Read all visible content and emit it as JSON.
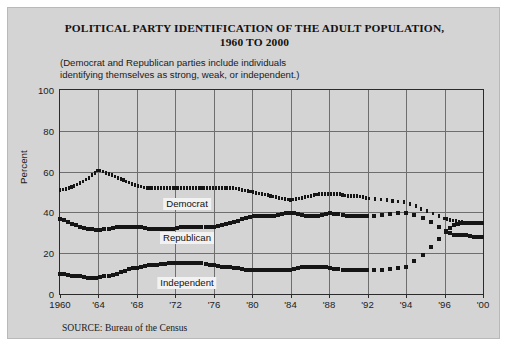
{
  "figure": {
    "title_line1": "POLITICAL PARTY IDENTIFICATION OF THE ADULT POPULATION,",
    "title_line2": "1960 TO 2000",
    "subtitle_line1": "(Democrat and Republican parties include individuals",
    "subtitle_line2": "identifying themselves as strong, weak, or independent.)",
    "source": "SOURCE: Bureau of the Census",
    "background_color": "#d4d4d4",
    "ink_color": "#151515",
    "grid_color": "#6e6e6e"
  },
  "chart_data": {
    "type": "line",
    "title": "POLITICAL PARTY IDENTIFICATION OF THE ADULT POPULATION, 1960 TO 2000",
    "subtitle": "(Democrat and Republican parties include individuals identifying themselves as strong, weak, or independent.)",
    "xlabel": "",
    "ylabel": "Percent",
    "ylim": [
      0,
      100
    ],
    "yticks": [
      0,
      20,
      40,
      60,
      80,
      100
    ],
    "xticks": [
      "1960",
      "'64",
      "'68",
      "'72",
      "'76",
      "'80",
      "'84",
      "'88",
      "'92",
      "'94",
      "'96",
      "'00"
    ],
    "xtick_positions": [
      0,
      9.1,
      18.2,
      27.3,
      36.4,
      45.5,
      54.5,
      63.6,
      72.7,
      81.8,
      90.9,
      100
    ],
    "grid": true,
    "legend": "inline-labels",
    "x": [
      1960,
      1961,
      1962,
      1963,
      1964,
      1965,
      1966,
      1967,
      1968,
      1969,
      1970,
      1971,
      1972,
      1973,
      1974,
      1975,
      1976,
      1977,
      1978,
      1979,
      1980,
      1981,
      1982,
      1983,
      1984,
      1985,
      1986,
      1987,
      1988,
      1989,
      1990,
      1991,
      1992,
      1993,
      1994,
      1995,
      1996,
      1997,
      1998,
      1999,
      2000
    ],
    "series": [
      {
        "name": "Democrat",
        "label": "Democrat",
        "marker": "small-rect",
        "values": [
          51,
          52,
          54,
          57,
          61,
          59,
          57,
          55,
          53,
          52,
          52,
          52,
          52,
          52,
          52,
          52,
          52,
          52,
          52,
          51,
          50,
          49,
          48,
          47,
          46,
          47,
          48,
          49,
          49,
          49,
          48,
          48,
          47,
          46,
          45,
          41,
          37,
          36,
          35,
          35,
          35
        ]
      },
      {
        "name": "Republican",
        "label": "Republican",
        "marker": "square",
        "values": [
          37,
          35,
          33,
          32,
          31,
          32,
          33,
          33,
          33,
          32,
          32,
          32,
          32,
          33,
          33,
          33,
          33,
          34,
          35,
          37,
          38,
          38,
          38,
          39,
          40,
          39,
          38,
          38,
          40,
          39,
          38,
          38,
          38,
          39,
          40,
          37,
          31,
          29,
          29,
          28,
          28
        ]
      },
      {
        "name": "Independent",
        "label": "Independent",
        "marker": "square",
        "values": [
          10,
          9,
          9,
          8,
          8,
          9,
          10,
          12,
          13,
          14,
          14,
          15,
          15,
          15,
          15,
          15,
          14,
          13,
          13,
          12,
          12,
          12,
          12,
          12,
          12,
          13,
          13,
          13,
          13,
          12,
          12,
          12,
          12,
          12,
          13,
          20,
          30,
          34,
          35,
          35,
          35
        ]
      }
    ]
  },
  "axis": {
    "ylabel": "Percent"
  }
}
